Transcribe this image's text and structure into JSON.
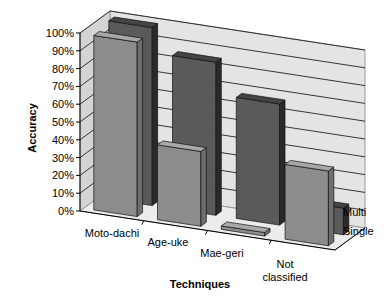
{
  "chart_data": {
    "type": "bar",
    "subtype": "3d-column",
    "title": "",
    "xlabel": "Techniques",
    "ylabel": "Accuracy",
    "categories": [
      "Moto-dachi",
      "Age-uke",
      "Mae-geri",
      "Not classified"
    ],
    "category_labels": [
      [
        "Moto-dachi"
      ],
      [
        "Age-uke"
      ],
      [
        "Mae-geri"
      ],
      [
        "Not",
        "classified"
      ]
    ],
    "series": [
      {
        "name": "Single",
        "values": [
          98,
          42,
          2,
          42
        ],
        "color": "#8c8c8c",
        "side": "#6e6e6e",
        "top": "#a8a8a8"
      },
      {
        "name": "Multi",
        "values": [
          100,
          86,
          68,
          15
        ],
        "color": "#5a5a5a",
        "side": "#2a2a2a",
        "top": "#444444"
      }
    ],
    "series_axis_labels": [
      "Multi",
      "Single"
    ],
    "yticks": [
      "0%",
      "10%",
      "20%",
      "30%",
      "40%",
      "50%",
      "60%",
      "70%",
      "80%",
      "90%",
      "100%"
    ],
    "ylim": [
      0,
      100
    ],
    "grid": true,
    "legend": "none (depth axis labels)",
    "wall_color": "#e4e4e4",
    "floor_color": "#ececec"
  }
}
